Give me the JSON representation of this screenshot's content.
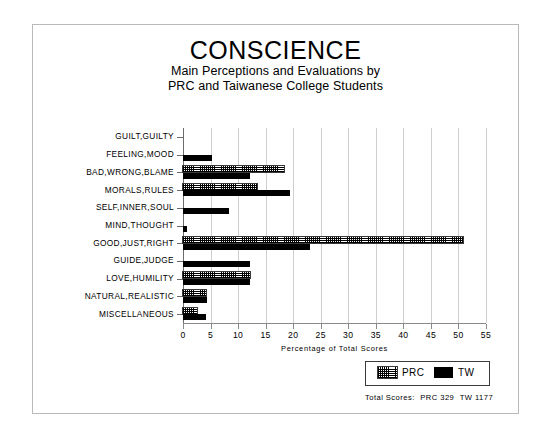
{
  "figure": {
    "title": "CONSCIENCE",
    "subtitle_line1": "Main Perceptions and Evaluations by",
    "subtitle_line2": "PRC and Taiwanese College Students"
  },
  "legend": {
    "position": "bottom-right",
    "entries": [
      {
        "label": "PRC",
        "swatch": "hatched",
        "color": "#000000"
      },
      {
        "label": "TW",
        "swatch": "solid",
        "color": "#000000"
      }
    ]
  },
  "footer": {
    "totals_label": "Total Scores:",
    "prc_total": "PRC 329",
    "tw_total": "TW 1177"
  },
  "chart_data": {
    "type": "bar",
    "orientation": "horizontal",
    "title": "CONSCIENCE",
    "subtitle": "Main Perceptions and Evaluations by PRC and Taiwanese College Students",
    "xlabel": "Percentage of Total Scores",
    "ylabel": "",
    "xlim": [
      0,
      55
    ],
    "xticks": [
      0,
      5,
      10,
      15,
      20,
      25,
      30,
      35,
      40,
      45,
      50,
      55
    ],
    "grid": true,
    "legend_position": "bottom-right",
    "categories": [
      "GUILT,GUILTY",
      "FEELING,MOOD",
      "BAD,WRONG,BLAME",
      "MORALS,RULES",
      "SELF,INNER,SOUL",
      "MIND,THOUGHT",
      "GOOD,JUST,RIGHT",
      "GUIDE,JUDGE",
      "LOVE,HUMILITY",
      "NATURAL,REALISTIC",
      "MISCELLANEOUS"
    ],
    "series": [
      {
        "name": "PRC",
        "values": [
          0,
          0,
          18.3,
          13.5,
          0,
          0,
          50.9,
          0,
          12.1,
          4.2,
          2.6
        ]
      },
      {
        "name": "TW",
        "values": [
          0,
          5.2,
          12.1,
          19.4,
          8.4,
          0.8,
          23.0,
          12.1,
          12.1,
          4.4,
          4.1
        ]
      }
    ],
    "totals": {
      "PRC": 329,
      "TW": 1177
    }
  }
}
